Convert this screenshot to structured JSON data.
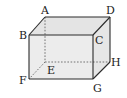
{
  "diagram": {
    "type": "rectangular-prism",
    "colors": {
      "edge": "#2a2a2a",
      "hidden_edge": "#555555",
      "front_face": "#ececec",
      "top_face": "#e4e4e4",
      "side_face": "#e6e6e6",
      "background": "#ffffff"
    },
    "vertices": {
      "A": {
        "label": "A",
        "x": 45,
        "y": 17
      },
      "B": {
        "label": "B",
        "x": 29,
        "y": 35
      },
      "C": {
        "label": "C",
        "x": 93,
        "y": 35
      },
      "D": {
        "label": "D",
        "x": 110,
        "y": 17
      },
      "E": {
        "label": "E",
        "x": 45,
        "y": 62
      },
      "F": {
        "label": "F",
        "x": 29,
        "y": 79
      },
      "G": {
        "label": "G",
        "x": 93,
        "y": 79
      },
      "H": {
        "label": "H",
        "x": 110,
        "y": 62
      }
    },
    "visible_edges": [
      "AB",
      "AD",
      "DC",
      "BC",
      "BF",
      "CG",
      "FG",
      "DH",
      "GH"
    ],
    "hidden_edges": [
      "AE",
      "EF",
      "EH"
    ]
  }
}
